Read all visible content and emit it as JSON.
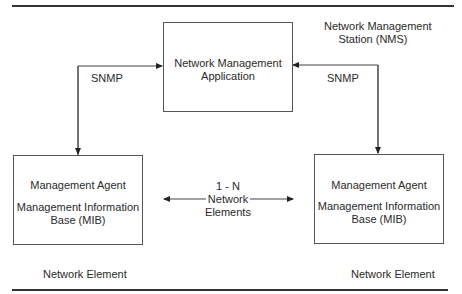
{
  "diagram": {
    "station_label": [
      "Network Management",
      "Station (NMS)"
    ],
    "nms_box": {
      "lines": [
        "Network Management",
        "Application"
      ]
    },
    "left_agent": {
      "line1": "Management Agent",
      "line2": "Management Information",
      "line3": "Base (MIB)"
    },
    "right_agent": {
      "line1": "Management Agent",
      "line2": "Management Information",
      "line3": "Base (MIB)"
    },
    "left_link_label": "SNMP",
    "right_link_label": "SNMP",
    "center_label": [
      "1 - N",
      "Network",
      "Elements"
    ],
    "left_element_label": "Network Element",
    "right_element_label": "Network Element"
  }
}
